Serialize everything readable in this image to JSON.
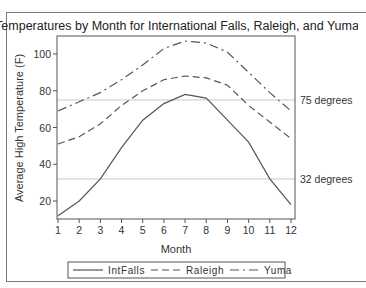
{
  "chart_data": {
    "type": "line",
    "title": "Temperatures by Month for International Falls, Raleigh, and Yuma",
    "xlabel": "Month",
    "ylabel": "Average High Temperature (F)",
    "x": [
      1,
      2,
      3,
      4,
      5,
      6,
      7,
      8,
      9,
      10,
      11,
      12
    ],
    "x_ticks": [
      "1",
      "2",
      "3",
      "4",
      "5",
      "6",
      "7",
      "8",
      "9",
      "10",
      "11",
      "12"
    ],
    "y_ticks": [
      "20",
      "40",
      "60",
      "80",
      "100"
    ],
    "y_tick_values": [
      20,
      40,
      60,
      80,
      100
    ],
    "xlim": [
      1,
      12
    ],
    "ylim": [
      10,
      109
    ],
    "grid": false,
    "legend_position": "bottom",
    "series": [
      {
        "name": "IntFalls",
        "style": "solid",
        "values": [
          12,
          20,
          32,
          49,
          64,
          73,
          78,
          76,
          64,
          52,
          32,
          18
        ]
      },
      {
        "name": "Raleigh",
        "style": "dash",
        "values": [
          51,
          55,
          62,
          72,
          80,
          86,
          88,
          87,
          83,
          72,
          63,
          54
        ]
      },
      {
        "name": "Yuma",
        "style": "dashdot",
        "values": [
          69,
          74,
          79,
          86,
          94,
          103,
          107,
          106,
          101,
          90,
          79,
          69
        ]
      }
    ],
    "reference_lines": [
      {
        "value": 75,
        "label": "75 degrees"
      },
      {
        "value": 32,
        "label": "32 degrees"
      }
    ],
    "colors": {
      "series": "#555555",
      "reference": "#c8c8c8",
      "axis": "#555555"
    }
  }
}
